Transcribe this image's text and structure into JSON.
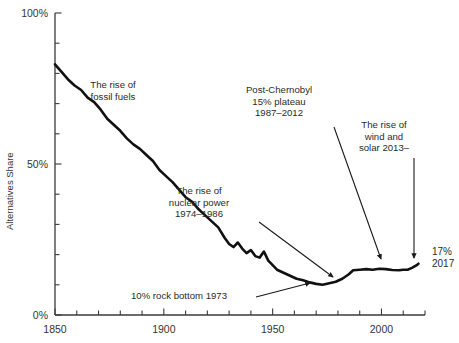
{
  "chart_data": {
    "type": "line",
    "title": "",
    "xlabel": "",
    "ylabel": "Alternatives Share",
    "xlim": [
      1850,
      2020
    ],
    "ylim": [
      0,
      100
    ],
    "grid": false,
    "legend": "none",
    "x_ticks_major": [
      1850,
      1900,
      1950,
      2000
    ],
    "x_tick_labels": [
      "1850",
      "1900",
      "1950",
      "2000"
    ],
    "x_tick_minor_step": 10,
    "y_ticks_major": [
      0,
      50,
      100
    ],
    "y_tick_labels": [
      "0%",
      "50%",
      "100%"
    ],
    "y_tick_minor_step": 10,
    "series": [
      {
        "name": "Alternatives Share",
        "x": [
          1850,
          1853,
          1856,
          1859,
          1862,
          1865,
          1868,
          1871,
          1874,
          1877,
          1880,
          1883,
          1886,
          1889,
          1892,
          1895,
          1898,
          1901,
          1904,
          1907,
          1910,
          1913,
          1916,
          1919,
          1922,
          1925,
          1928,
          1930,
          1932,
          1934,
          1936,
          1938,
          1940,
          1942,
          1944,
          1946,
          1948,
          1950,
          1952,
          1955,
          1958,
          1961,
          1964,
          1967,
          1970,
          1973,
          1976,
          1979,
          1982,
          1985,
          1987,
          1990,
          1993,
          1996,
          1999,
          2002,
          2005,
          2008,
          2010,
          2012,
          2014,
          2016,
          2017
        ],
        "values": [
          83.0,
          80.5,
          78.0,
          76.0,
          74.5,
          72.0,
          70.5,
          68.0,
          65.0,
          63.0,
          61.0,
          58.5,
          56.5,
          55.0,
          53.0,
          51.0,
          48.0,
          46.0,
          44.0,
          41.5,
          39.0,
          37.5,
          35.0,
          33.0,
          31.0,
          29.0,
          25.5,
          23.5,
          22.5,
          24.0,
          22.0,
          20.5,
          21.5,
          19.5,
          19.0,
          21.0,
          18.0,
          16.5,
          15.0,
          14.0,
          13.0,
          12.0,
          11.5,
          10.8,
          10.3,
          10.0,
          10.5,
          11.0,
          12.0,
          13.5,
          14.8,
          15.0,
          15.2,
          15.0,
          15.3,
          15.2,
          14.9,
          14.8,
          15.0,
          15.0,
          15.6,
          16.4,
          17.0
        ]
      }
    ],
    "annotations": [
      {
        "name": "rise-of-fossil-fuels",
        "lines": [
          "The rise of",
          "fossil fuels"
        ],
        "x_px": 113,
        "y_px": 88,
        "has_arrow": false
      },
      {
        "name": "rise-of-nuclear-power",
        "lines": [
          "The rise of",
          "nuclear power",
          "1974–1986"
        ],
        "x_px": 199,
        "y_px": 194,
        "has_arrow": true,
        "arrow_from_px": [
          259,
          222
        ],
        "arrow_to_px": [
          333,
          277
        ]
      },
      {
        "name": "post-chernobyl-plateau",
        "lines": [
          "Post-Chernobyl",
          "15% plateau",
          "1987–2012"
        ],
        "x_px": 279,
        "y_px": 93,
        "has_arrow": true,
        "arrow_from_px": [
          334,
          127
        ],
        "arrow_to_px": [
          381,
          259
        ]
      },
      {
        "name": "rise-of-wind-and-solar",
        "lines": [
          "The rise of",
          "wind and",
          "solar 2013–"
        ],
        "x_px": 384,
        "y_px": 128,
        "has_arrow": true,
        "arrow_from_px": [
          414,
          158
        ],
        "arrow_to_px": [
          414,
          258
        ]
      },
      {
        "name": "rock-bottom-1973",
        "lines": [
          "10% rock bottom 1973"
        ],
        "x_px": 131,
        "y_px": 299,
        "has_arrow": true,
        "arrow_from_px": [
          256,
          297
        ],
        "arrow_to_px": [
          310,
          283
        ]
      },
      {
        "name": "endpoint-value",
        "lines": [
          "17%",
          "2017"
        ],
        "x_px": 432,
        "y_px": 255,
        "has_arrow": false
      }
    ],
    "colors": {
      "line": "#111111",
      "axis": "#3a3a3a",
      "text": "#2b2b2b",
      "background": "#ffffff"
    }
  }
}
